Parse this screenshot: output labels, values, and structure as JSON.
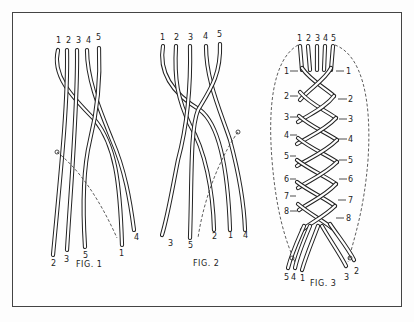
{
  "figures": [
    {
      "id": "fig1",
      "caption": "FIG. 1",
      "top_labels": [
        "1",
        "2",
        "3",
        "4",
        "5"
      ],
      "bottom_labels": [
        "2",
        "3",
        "5",
        "1",
        "4"
      ]
    },
    {
      "id": "fig2",
      "caption": "FIG. 2",
      "top_labels": [
        "1",
        "2",
        "3",
        "4",
        "5"
      ],
      "bottom_labels": [
        "3",
        "5",
        "2",
        "1",
        "4"
      ]
    },
    {
      "id": "fig3",
      "caption": "FIG. 3",
      "top_labels": [
        "1",
        "2",
        "3",
        "4",
        "5"
      ],
      "left_step_labels": [
        "1",
        "2",
        "3",
        "4",
        "5",
        "6",
        "7",
        "8"
      ],
      "right_step_labels": [
        "1",
        "2",
        "3",
        "4",
        "5",
        "6",
        "7",
        "8"
      ],
      "bottom_labels": [
        "5",
        "4",
        "1",
        "3",
        "2"
      ]
    }
  ],
  "colors": {
    "ink": "#222222",
    "frame": "#444444",
    "background": "#fdfdfd"
  }
}
